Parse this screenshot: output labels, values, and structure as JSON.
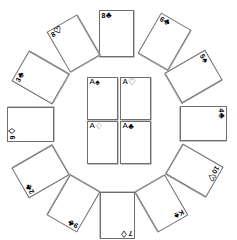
{
  "scene": {
    "title": "Playing cards arranged in a circle with four aces in the center",
    "background_color": "#ffffff",
    "card_border_color": "#6f6f6f",
    "ink_color": "#000000",
    "width": 237,
    "height": 240
  },
  "suits": {
    "spade": "♠",
    "heart": "♡",
    "diamond": "♢",
    "club": "♣",
    "spade_solid": "♠",
    "club_solid": "♣"
  },
  "center": {
    "label": "four aces",
    "cards": [
      {
        "name": "ace-of-spades",
        "rank": "A",
        "suit": "♠",
        "suit_name": "spades",
        "x": 87,
        "y": 77,
        "w": 31,
        "h": 43,
        "rotation": 0
      },
      {
        "name": "ace-of-hearts",
        "rank": "A",
        "suit": "♡",
        "suit_name": "hearts",
        "x": 120,
        "y": 77,
        "w": 31,
        "h": 43,
        "rotation": 0
      },
      {
        "name": "ace-of-diamonds",
        "rank": "A",
        "suit": "♢",
        "suit_name": "diamonds",
        "x": 87,
        "y": 121,
        "w": 31,
        "h": 43,
        "rotation": 0
      },
      {
        "name": "ace-of-clubs",
        "rank": "A",
        "suit": "♣",
        "suit_name": "clubs",
        "x": 120,
        "y": 121,
        "w": 31,
        "h": 43,
        "rotation": 0
      }
    ]
  },
  "ring": {
    "label": "twelve cards in a circle",
    "cards": [
      {
        "name": "eight-of-clubs",
        "rank": "8",
        "suit": "♣",
        "suit_name": "clubs",
        "x": 99,
        "y": 10,
        "w": 35,
        "h": 47,
        "rotation": 0
      },
      {
        "name": "six-of-clubs",
        "rank": "6",
        "suit": "♣",
        "suit_name": "clubs",
        "x": 147,
        "y": 18,
        "w": 35,
        "h": 47,
        "rotation": 30
      },
      {
        "name": "five-of-spades",
        "rank": "5",
        "suit": "♠",
        "suit_name": "spades",
        "x": 176,
        "y": 53,
        "w": 35,
        "h": 47,
        "rotation": 60
      },
      {
        "name": "four-of-clubs",
        "rank": "4",
        "suit": "♣",
        "suit_name": "clubs",
        "x": 186,
        "y": 100,
        "w": 35,
        "h": 47,
        "rotation": 90
      },
      {
        "name": "ten-of-hearts",
        "rank": "10",
        "suit": "♡",
        "suit_name": "hearts",
        "x": 177,
        "y": 147,
        "w": 35,
        "h": 47,
        "rotation": 120
      },
      {
        "name": "king-of-spades",
        "rank": "K",
        "suit": "♠",
        "suit_name": "spades",
        "x": 144,
        "y": 180,
        "w": 35,
        "h": 47,
        "rotation": 150
      },
      {
        "name": "seven-of-diamonds",
        "rank": "7",
        "suit": "♢",
        "suit_name": "diamonds",
        "x": 100,
        "y": 192,
        "w": 35,
        "h": 47,
        "rotation": 180
      },
      {
        "name": "nine-of-clubs",
        "rank": "9",
        "suit": "♣",
        "suit_name": "clubs",
        "x": 56,
        "y": 180,
        "w": 35,
        "h": 47,
        "rotation": 210
      },
      {
        "name": "two-of-clubs",
        "rank": "2",
        "suit": "♣",
        "suit_name": "clubs",
        "x": 23,
        "y": 148,
        "w": 35,
        "h": 47,
        "rotation": 240
      },
      {
        "name": "nine-of-diamonds",
        "rank": "9",
        "suit": "♢",
        "suit_name": "diamonds",
        "x": 13,
        "y": 101,
        "w": 35,
        "h": 47,
        "rotation": 270
      },
      {
        "name": "three-of-clubs",
        "rank": "3",
        "suit": "♣",
        "suit_name": "clubs",
        "x": 23,
        "y": 54,
        "w": 35,
        "h": 47,
        "rotation": 300
      },
      {
        "name": "eight-of-hearts",
        "rank": "8",
        "suit": "♡",
        "suit_name": "hearts",
        "x": 56,
        "y": 20,
        "w": 35,
        "h": 47,
        "rotation": 330
      }
    ]
  }
}
